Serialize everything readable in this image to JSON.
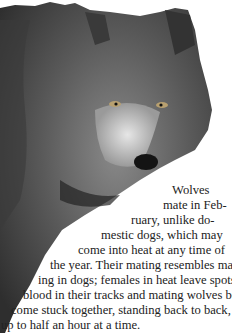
{
  "photo": {
    "subject": "grey wolf portrait",
    "style": "grayscale cutout"
  },
  "article": {
    "lines": [
      "Wolves",
      "mate in Feb-",
      "ruary, unlike do-",
      "mestic dogs, which may",
      "come into heat at any time of",
      "the year. Their mating resembles mat-",
      "ing in dogs; females in heat leave spots of",
      "blood in their tracks and mating wolves be-",
      "come stuck together, standing back to back, for",
      "up to half an hour at a time.",
      "Usually, only the alpha animals of a pack"
    ]
  }
}
